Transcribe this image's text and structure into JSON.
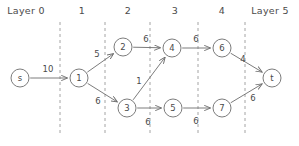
{
  "figure": {
    "kind": "layered-directed-graph",
    "background_color": "#ffffff",
    "ink_color": "#4a4a4a",
    "stroke_color": "#6d6d6d",
    "divider_color": "#9a9a9a"
  },
  "layer_labels": [
    {
      "id": "layer-0",
      "text": "Layer 0",
      "x": 26,
      "y": 14
    },
    {
      "id": "layer-1",
      "text": "1",
      "x": 82,
      "y": 14
    },
    {
      "id": "layer-2",
      "text": "2",
      "x": 128,
      "y": 14
    },
    {
      "id": "layer-3",
      "text": "3",
      "x": 175,
      "y": 14
    },
    {
      "id": "layer-4",
      "text": "4",
      "x": 222,
      "y": 14
    },
    {
      "id": "layer-5",
      "text": "Layer 5",
      "x": 270,
      "y": 14
    }
  ],
  "dividers": [
    {
      "id": "divider-0-1",
      "x": 60,
      "y1": 22,
      "y2": 136
    },
    {
      "id": "divider-1-2",
      "x": 105,
      "y1": 22,
      "y2": 136
    },
    {
      "id": "divider-2-3",
      "x": 150,
      "y1": 22,
      "y2": 136
    },
    {
      "id": "divider-3-4",
      "x": 198,
      "y1": 22,
      "y2": 136
    },
    {
      "id": "divider-4-5",
      "x": 245,
      "y1": 22,
      "y2": 136
    }
  ],
  "nodes": [
    {
      "id": "s",
      "label": "s",
      "x": 20,
      "y": 78,
      "r": 9,
      "layer": 0
    },
    {
      "id": "n1",
      "label": "1",
      "x": 79,
      "y": 78,
      "r": 9,
      "layer": 1
    },
    {
      "id": "n2",
      "label": "2",
      "x": 123,
      "y": 47,
      "r": 9,
      "layer": 2
    },
    {
      "id": "n3",
      "label": "3",
      "x": 127,
      "y": 108,
      "r": 9,
      "layer": 2
    },
    {
      "id": "n4",
      "label": "4",
      "x": 172,
      "y": 48,
      "r": 9,
      "layer": 3
    },
    {
      "id": "n5",
      "label": "5",
      "x": 173,
      "y": 108,
      "r": 9,
      "layer": 3
    },
    {
      "id": "n6",
      "label": "6",
      "x": 222,
      "y": 48,
      "r": 9,
      "layer": 4
    },
    {
      "id": "n7",
      "label": "7",
      "x": 222,
      "y": 108,
      "r": 9,
      "layer": 4
    },
    {
      "id": "t",
      "label": "t",
      "x": 272,
      "y": 78,
      "r": 9,
      "layer": 5
    }
  ],
  "edges": [
    {
      "id": "s-1",
      "from": "s",
      "to": "n1",
      "weight": "10",
      "wx": 48,
      "wy": 72
    },
    {
      "id": "1-2",
      "from": "n1",
      "to": "n2",
      "weight": "5",
      "wx": 97,
      "wy": 57
    },
    {
      "id": "1-3",
      "from": "n1",
      "to": "n3",
      "weight": "6",
      "wx": 98,
      "wy": 104
    },
    {
      "id": "2-4",
      "from": "n2",
      "to": "n4",
      "weight": "6",
      "wx": 146,
      "wy": 42
    },
    {
      "id": "3-4",
      "from": "n3",
      "to": "n4",
      "weight": "1",
      "wx": 139,
      "wy": 84
    },
    {
      "id": "3-5",
      "from": "n3",
      "to": "n5",
      "weight": "6",
      "wx": 148,
      "wy": 125
    },
    {
      "id": "4-6",
      "from": "n4",
      "to": "n6",
      "weight": "6",
      "wx": 196,
      "wy": 42
    },
    {
      "id": "5-7",
      "from": "n5",
      "to": "n7",
      "weight": "6",
      "wx": 196,
      "wy": 124
    },
    {
      "id": "6-t",
      "from": "n6",
      "to": "t",
      "weight": "4",
      "wx": 243,
      "wy": 62
    },
    {
      "id": "7-t",
      "from": "n7",
      "to": "t",
      "weight": "6",
      "wx": 253,
      "wy": 101
    }
  ],
  "chart_data": {
    "type": "diagram",
    "title": "",
    "layers": [
      "Layer 0",
      "1",
      "2",
      "3",
      "4",
      "Layer 5"
    ],
    "nodes": [
      "s",
      "1",
      "2",
      "3",
      "4",
      "5",
      "6",
      "7",
      "t"
    ],
    "edge_list": [
      {
        "from": "s",
        "to": "1",
        "weight": 10
      },
      {
        "from": "1",
        "to": "2",
        "weight": 5
      },
      {
        "from": "1",
        "to": "3",
        "weight": 6
      },
      {
        "from": "2",
        "to": "4",
        "weight": 6
      },
      {
        "from": "3",
        "to": "4",
        "weight": 1
      },
      {
        "from": "3",
        "to": "5",
        "weight": 6
      },
      {
        "from": "4",
        "to": "6",
        "weight": 6
      },
      {
        "from": "5",
        "to": "7",
        "weight": 6
      },
      {
        "from": "6",
        "to": "t",
        "weight": 4
      },
      {
        "from": "7",
        "to": "t",
        "weight": 6
      }
    ]
  }
}
